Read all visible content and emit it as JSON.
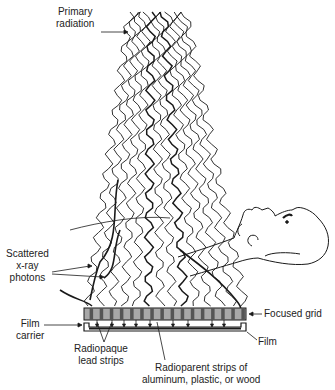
{
  "diagram": {
    "labels": {
      "primary_radiation": [
        "Primary",
        "radiation"
      ],
      "scattered": [
        "Scattered",
        "x-ray",
        "photons"
      ],
      "film_carrier": [
        "Film",
        "carrier"
      ],
      "focused_grid": "Focused grid",
      "film": "Film",
      "radiopaque": [
        "Radiopaque",
        "lead strips"
      ],
      "radioparent": [
        "Radioparent strips of",
        "aluminum, plastic, or wood"
      ]
    },
    "colors": {
      "line": "#1a1a1a",
      "grid_light": "#a8a8a8",
      "grid_dark": "#555555",
      "text": "#222222"
    },
    "beam": {
      "top_left_x": 130,
      "top_right_x": 185,
      "top_y": 12,
      "bottom_left_x": 88,
      "bottom_right_x": 245,
      "bottom_y": 306,
      "wave_count": 14
    },
    "grid": {
      "x": 84,
      "y": 308,
      "width": 162,
      "height": 12,
      "strip_count": 16
    }
  }
}
